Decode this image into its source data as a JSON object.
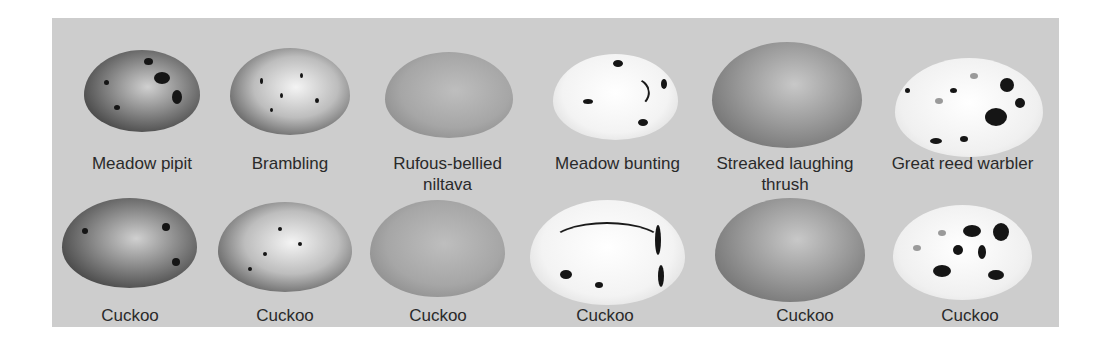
{
  "figure": {
    "host_row": [
      {
        "label_line1": "Meadow pipit",
        "label_line2": "",
        "pattern": "dark-speckled"
      },
      {
        "label_line1": "Brambling",
        "label_line2": "",
        "pattern": "light-speckled"
      },
      {
        "label_line1": "Rufous-bellied",
        "label_line2": "niltava",
        "pattern": "plain-gray"
      },
      {
        "label_line1": "Meadow bunting",
        "label_line2": "",
        "pattern": "white-scrawled"
      },
      {
        "label_line1": "Streaked laughing",
        "label_line2": "thrush",
        "pattern": "plain-dark"
      },
      {
        "label_line1": "Great reed warbler",
        "label_line2": "",
        "pattern": "white-blotched"
      }
    ],
    "cuckoo_row": [
      {
        "label": "Cuckoo",
        "pattern": "dark-speckled"
      },
      {
        "label": "Cuckoo",
        "pattern": "light-speckled"
      },
      {
        "label": "Cuckoo",
        "pattern": "plain-gray"
      },
      {
        "label": "Cuckoo",
        "pattern": "white-scrawled"
      },
      {
        "label": "Cuckoo",
        "pattern": "plain-dark"
      },
      {
        "label": "Cuckoo",
        "pattern": "white-blotched"
      }
    ],
    "colors": {
      "panel_background": "#cdcdcd",
      "label_text": "#2a2a2a",
      "page_background": "#ffffff"
    }
  }
}
